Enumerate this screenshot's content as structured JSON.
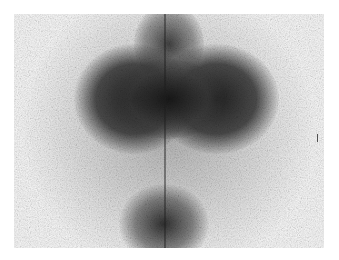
{
  "image": {
    "description": "Grayscale scintigraphy scan showing dark uptake regions: a central upper mass with bilateral lobes and a smaller lower blob, with a vertical midline",
    "colors": {
      "background": "#ffffff",
      "dark": "#1e1e1e",
      "mid": "#7a7a7a",
      "light": "#f4f4f4"
    }
  }
}
